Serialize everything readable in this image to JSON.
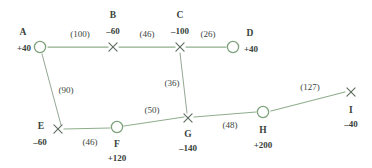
{
  "diagram": {
    "type": "network-flow-graph",
    "background_color": "#ffffff",
    "edge_color": "#8fae8d",
    "node_stroke_color": "#7ea37c",
    "text_color": "#37423a",
    "node_shapes": {
      "circle": "transshipment-or-supply-node-circle",
      "cross": "node-marker-cross"
    }
  },
  "nodes": [
    {
      "id": "A",
      "label": "A",
      "supply": "+40",
      "shape": "circle",
      "x": 40,
      "y": 47,
      "name_x": 23,
      "name_y": 33,
      "supply_x": 24,
      "supply_y": 48
    },
    {
      "id": "B",
      "label": "B",
      "supply": "–60",
      "shape": "cross",
      "x": 113,
      "y": 47,
      "name_x": 113,
      "name_y": 16,
      "supply_x": 113,
      "supply_y": 31
    },
    {
      "id": "C",
      "label": "C",
      "supply": "–100",
      "shape": "cross",
      "x": 180,
      "y": 47,
      "name_x": 180,
      "name_y": 16,
      "supply_x": 180,
      "supply_y": 31
    },
    {
      "id": "D",
      "label": "D",
      "supply": "+40",
      "shape": "circle",
      "x": 233,
      "y": 47,
      "name_x": 250,
      "name_y": 34,
      "supply_x": 251,
      "supply_y": 49
    },
    {
      "id": "E",
      "label": "E",
      "supply": "–60",
      "shape": "cross",
      "x": 58,
      "y": 129,
      "name_x": 41,
      "name_y": 127,
      "supply_x": 40,
      "supply_y": 142
    },
    {
      "id": "F",
      "label": "F",
      "supply": "+120",
      "shape": "circle",
      "x": 117,
      "y": 127,
      "name_x": 117,
      "name_y": 145,
      "supply_x": 117,
      "supply_y": 158
    },
    {
      "id": "G",
      "label": "G",
      "supply": "–140",
      "shape": "cross",
      "x": 188,
      "y": 118,
      "name_x": 188,
      "name_y": 135,
      "supply_x": 188,
      "supply_y": 148
    },
    {
      "id": "H",
      "label": "H",
      "supply": "+200",
      "shape": "circle",
      "x": 263,
      "y": 112,
      "name_x": 263,
      "name_y": 131,
      "supply_x": 263,
      "supply_y": 145
    },
    {
      "id": "I",
      "label": "I",
      "supply": "–40",
      "shape": "cross",
      "x": 351,
      "y": 92,
      "name_x": 351,
      "name_y": 111,
      "supply_x": 351,
      "supply_y": 124
    }
  ],
  "edges": [
    {
      "from": "A",
      "to": "B",
      "cost": "(100)",
      "x1": 48,
      "y1": 47,
      "x2": 108,
      "y2": 47,
      "label_x": 80,
      "label_y": 34
    },
    {
      "from": "B",
      "to": "C",
      "cost": "(46)",
      "x1": 119,
      "y1": 47,
      "x2": 175,
      "y2": 47,
      "label_x": 147,
      "label_y": 34
    },
    {
      "from": "C",
      "to": "D",
      "cost": "(26)",
      "x1": 186,
      "y1": 47,
      "x2": 226,
      "y2": 47,
      "label_x": 208,
      "label_y": 34
    },
    {
      "from": "A",
      "to": "E",
      "cost": "(90)",
      "x1": 42,
      "y1": 54,
      "x2": 61,
      "y2": 125,
      "label_x": 66,
      "label_y": 90
    },
    {
      "from": "C",
      "to": "G",
      "cost": "(36)",
      "x1": 180,
      "y1": 53,
      "x2": 187,
      "y2": 113,
      "label_x": 172,
      "label_y": 83
    },
    {
      "from": "E",
      "to": "F",
      "cost": "(46)",
      "x1": 64,
      "y1": 129,
      "x2": 110,
      "y2": 128,
      "label_x": 90,
      "label_y": 142
    },
    {
      "from": "F",
      "to": "G",
      "cost": "(50)",
      "x1": 124,
      "y1": 126,
      "x2": 184,
      "y2": 117,
      "label_x": 152,
      "label_y": 110
    },
    {
      "from": "G",
      "to": "H",
      "cost": "(48)",
      "x1": 194,
      "y1": 117,
      "x2": 256,
      "y2": 112,
      "label_x": 230,
      "label_y": 125
    },
    {
      "from": "H",
      "to": "I",
      "cost": "(127)",
      "x1": 271,
      "y1": 111,
      "x2": 345,
      "y2": 92,
      "label_x": 310,
      "label_y": 87
    }
  ]
}
